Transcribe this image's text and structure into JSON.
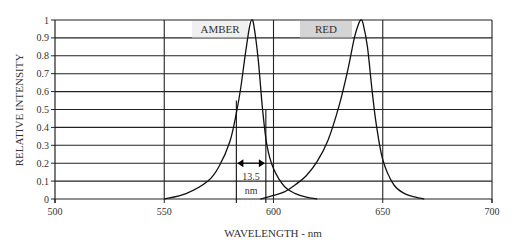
{
  "chart_data": {
    "type": "line",
    "title": "",
    "xlabel": "WAVELENGTH - nm",
    "ylabel": "RELATIVE INTENSITY",
    "xlim": [
      500,
      700
    ],
    "ylim": [
      0,
      1
    ],
    "x_ticks": [
      500,
      550,
      600,
      650,
      700
    ],
    "y_ticks": [
      0,
      0.1,
      0.2,
      0.3,
      0.4,
      0.5,
      0.6,
      0.7,
      0.8,
      0.9,
      1
    ],
    "y_tick_labels": [
      "0",
      "0.1",
      "0.2",
      "0.3",
      "0.4",
      "0.5",
      "0.6",
      "0.7",
      "0.8",
      "0.9",
      "1"
    ],
    "grid": {
      "horizontal": true,
      "vertical_at": [
        550,
        600,
        650
      ]
    },
    "legend": "inline labels",
    "series": [
      {
        "name": "AMBER",
        "label_box_fill": "#f0f0f0",
        "peak_nm": 590,
        "x": [
          550,
          560,
          570,
          575,
          580,
          583,
          585,
          587,
          589,
          590,
          591,
          593,
          595,
          597,
          600,
          605,
          610,
          615,
          620
        ],
        "y": [
          0.0,
          0.03,
          0.1,
          0.18,
          0.32,
          0.48,
          0.62,
          0.8,
          0.96,
          1.0,
          0.97,
          0.78,
          0.5,
          0.3,
          0.17,
          0.07,
          0.03,
          0.01,
          0.0
        ]
      },
      {
        "name": "RED",
        "label_box_fill": "#d4d4d4",
        "peak_nm": 640,
        "x": [
          594,
          600,
          605,
          610,
          615,
          620,
          625,
          630,
          634,
          637,
          639,
          640,
          641,
          643,
          645,
          647,
          650,
          655,
          660,
          665,
          669
        ],
        "y": [
          0.0,
          0.02,
          0.04,
          0.08,
          0.13,
          0.21,
          0.33,
          0.52,
          0.72,
          0.9,
          0.98,
          1.0,
          0.98,
          0.85,
          0.62,
          0.42,
          0.22,
          0.08,
          0.03,
          0.01,
          0.0
        ]
      }
    ],
    "annotations": [
      {
        "type": "fwhm",
        "series": "AMBER",
        "x_left": 583,
        "x_right": 596.5,
        "arrow_y": 0.2,
        "text_line1": "13.5",
        "text_line2": "nm"
      }
    ]
  }
}
